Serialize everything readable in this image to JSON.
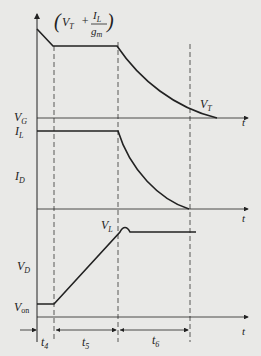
{
  "diagram": {
    "type": "timing-diagram",
    "colors": {
      "background": "#e9e9e7",
      "ink": "#222222"
    },
    "annotation": {
      "open": "(",
      "vt": "V",
      "vt_sub": "T",
      "plus": "+",
      "num": "I",
      "num_sub": "L",
      "den": "g",
      "den_sub": "m",
      "close": ")"
    },
    "panels": [
      {
        "label": "V",
        "label_sub": "G",
        "axis_label": "t",
        "end_label": "V",
        "end_label_sub": "T"
      },
      {
        "label": "I",
        "label_sub": "D",
        "level_label": "I",
        "level_label_sub": "L",
        "axis_label": "t"
      },
      {
        "label": "V",
        "label_sub": "D",
        "level_label": "V",
        "level_label_sub": "L",
        "low_label": "V",
        "low_label_sub": "on",
        "axis_label": "t"
      }
    ],
    "intervals": [
      {
        "label": "t",
        "sub": "4"
      },
      {
        "label": "t",
        "sub": "5"
      },
      {
        "label": "t",
        "sub": "6"
      }
    ]
  }
}
